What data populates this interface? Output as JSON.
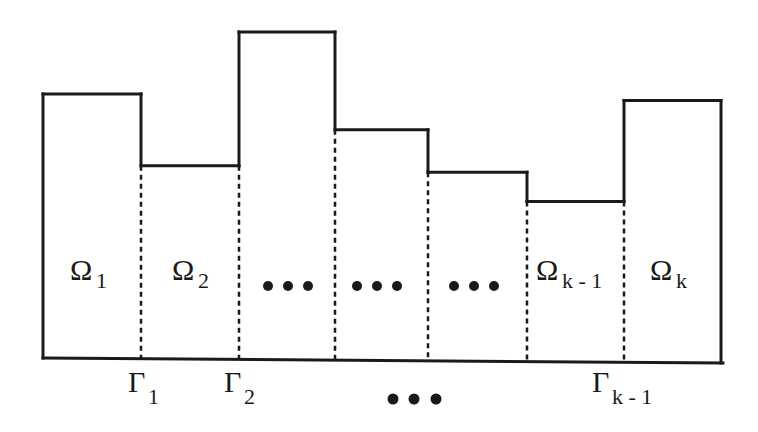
{
  "diagram": {
    "title": "",
    "subdomains": [
      {
        "symbol": "Ω",
        "subscript": "1",
        "relative_height": 0.81
      },
      {
        "symbol": "Ω",
        "subscript": "2",
        "relative_height": 0.59
      },
      {
        "symbol": "• • •",
        "subscript": "",
        "relative_height": 1.0
      },
      {
        "symbol": "• • •",
        "subscript": "",
        "relative_height": 0.7
      },
      {
        "symbol": "• • •",
        "subscript": "",
        "relative_height": 0.57
      },
      {
        "symbol": "Ω",
        "subscript": "k - 1",
        "relative_height": 0.48
      },
      {
        "symbol": "Ω",
        "subscript": "k",
        "relative_height": 0.79
      }
    ],
    "interfaces": [
      {
        "symbol": "Γ",
        "subscript": "1"
      },
      {
        "symbol": "Γ",
        "subscript": "2"
      },
      {
        "symbol": "",
        "subscript": ""
      },
      {
        "symbol": "",
        "subscript": ""
      },
      {
        "symbol": "",
        "subscript": ""
      },
      {
        "symbol": "Γ",
        "subscript": "k - 1"
      }
    ],
    "interface_ellipsis": "• • •",
    "line_color": "#1a1a1a"
  }
}
